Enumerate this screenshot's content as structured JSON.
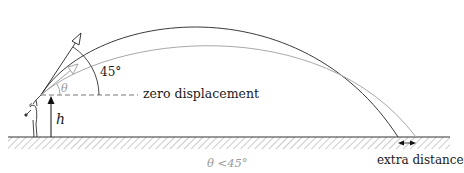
{
  "diagram": {
    "type": "projectile-trajectory",
    "labels": {
      "angle_45": "45°",
      "theta": "θ",
      "zero_displacement": "zero displacement",
      "height": "h",
      "extra_distance": "extra distance",
      "theta_condition": "θ <45°"
    },
    "colors": {
      "trajectory_45": "#3a3a3a",
      "trajectory_theta": "#a8a8a8",
      "ground": "#333333",
      "text_primary": "#1a1a1a",
      "text_secondary": "#9a9a9a"
    },
    "elements": [
      {
        "name": "thrower-figure",
        "desc": "person launching projectile from height h"
      },
      {
        "name": "trajectory-45",
        "desc": "dark arc launched at 45 degrees"
      },
      {
        "name": "trajectory-theta",
        "desc": "light gray arc launched at angle theta < 45 degrees, lands farther"
      },
      {
        "name": "ground",
        "desc": "hatched ground surface"
      }
    ]
  }
}
